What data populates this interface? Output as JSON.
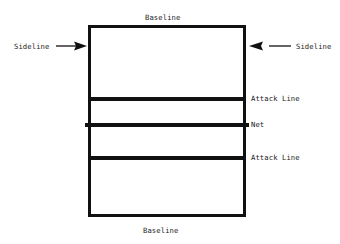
{
  "diagram": {
    "background_color": "#ffffff",
    "line_color": "#111111",
    "text_color": "#1a1a1a"
  },
  "labels": {
    "baseline_top": "Baseline",
    "baseline_bottom": "Baseline",
    "sideline_left": "Sideline",
    "sideline_right": "Sideline",
    "attack_line_top": "Attack Line",
    "net": "Net",
    "attack_line_bottom": "Attack Line"
  },
  "court": {
    "outline": {
      "x": 88,
      "y": 25,
      "width": 158,
      "height": 192,
      "stroke_width": 3.5
    },
    "interior_lines": [
      {
        "name": "attack-line-top",
        "y": 97,
        "x1": 88,
        "x2": 246,
        "stroke_width": 3.5
      },
      {
        "name": "net",
        "y": 123,
        "x1": 85,
        "x2": 249,
        "stroke_width": 3.5
      },
      {
        "name": "attack-line-bottom",
        "y": 156,
        "x1": 88,
        "x2": 246,
        "stroke_width": 3.5
      }
    ]
  },
  "arrows": [
    {
      "name": "sideline-arrow-left",
      "direction": "right",
      "x1": 58,
      "x2": 85,
      "y": 46
    },
    {
      "name": "sideline-arrow-right",
      "direction": "left",
      "x1": 290,
      "x2": 250,
      "y": 46
    }
  ]
}
